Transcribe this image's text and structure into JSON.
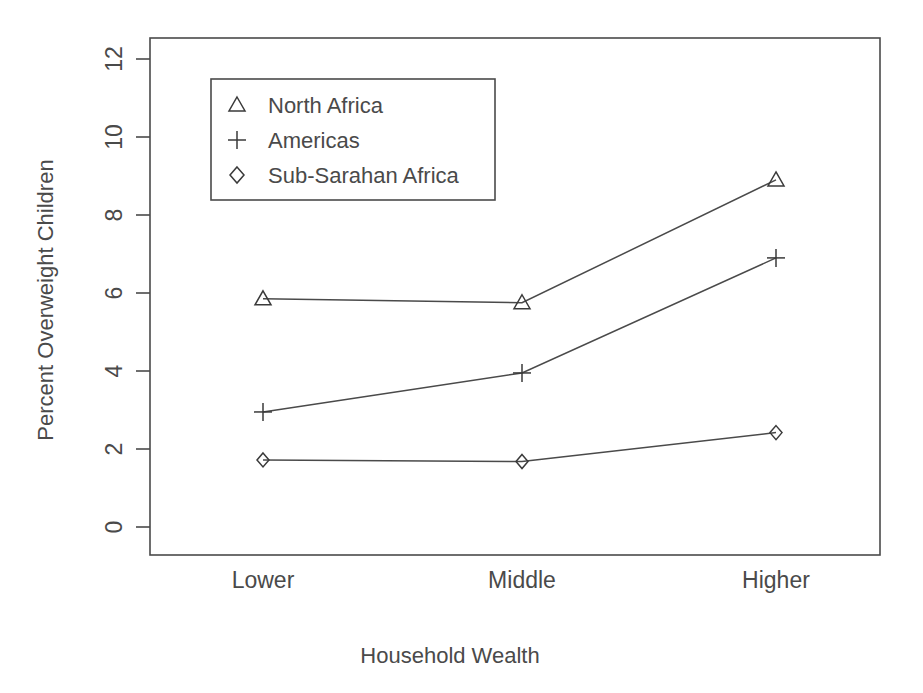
{
  "chart_data": {
    "type": "line",
    "title": "",
    "xlabel": "Household Wealth",
    "ylabel": "Percent Overweight Children",
    "categories": [
      "Lower",
      "Middle",
      "Higher"
    ],
    "ytick_labels": [
      "0",
      "2",
      "4",
      "6",
      "8",
      "10",
      "12"
    ],
    "yticks": [
      0,
      2,
      4,
      6,
      8,
      10,
      12
    ],
    "ylim": [
      0,
      12.4
    ],
    "grid": false,
    "legend_position": "top-left",
    "series": [
      {
        "name": "North Africa",
        "marker": "triangle",
        "values": [
          5.85,
          5.75,
          8.9
        ]
      },
      {
        "name": "Americas",
        "marker": "plus",
        "values": [
          2.95,
          3.95,
          6.9
        ]
      },
      {
        "name": "Sub-Sarahan Africa",
        "marker": "diamond",
        "values": [
          1.72,
          1.68,
          2.42
        ]
      }
    ],
    "line_color": "#4a4a4a",
    "background_color": "#ffffff"
  },
  "legend": {
    "items": [
      {
        "marker": "triangle-marker",
        "label": "North Africa"
      },
      {
        "marker": "plus-marker",
        "label": "Americas"
      },
      {
        "marker": "diamond-marker",
        "label": "Sub-Sarahan Africa"
      }
    ]
  },
  "axes": {
    "y_title": "Percent Overweight Children",
    "x_title": "Household Wealth",
    "y_ticks": [
      {
        "label": "12"
      },
      {
        "label": "10"
      },
      {
        "label": "8"
      },
      {
        "label": "6"
      },
      {
        "label": "4"
      },
      {
        "label": "2"
      },
      {
        "label": "0"
      }
    ],
    "x_categories": [
      {
        "label": "Lower"
      },
      {
        "label": "Middle"
      },
      {
        "label": "Higher"
      }
    ]
  }
}
